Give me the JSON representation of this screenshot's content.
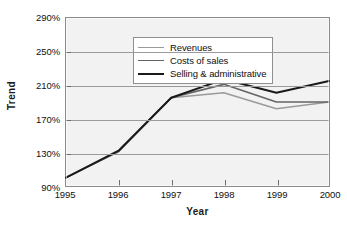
{
  "chart_data": {
    "type": "line",
    "title": "",
    "xlabel": "Year",
    "ylabel": "Trend",
    "categories": [
      "1995",
      "1996",
      "1997",
      "1998",
      "1999",
      "2000"
    ],
    "x": [
      1995,
      1996,
      1997,
      1998,
      1999,
      2000
    ],
    "xlim": [
      1995,
      2000
    ],
    "ylim": [
      90,
      290
    ],
    "yticks": [
      "90%",
      "130%",
      "170%",
      "210%",
      "250%",
      "290%"
    ],
    "ytick_values": [
      90,
      130,
      170,
      210,
      250,
      290
    ],
    "ytick_step": 40,
    "grid": "horizontal",
    "legend_position": "top-left",
    "series": [
      {
        "name": "Revenues",
        "color": "#9a9a9a",
        "values": [
          100,
          131,
          195,
          201,
          182,
          190
        ]
      },
      {
        "name": "Costs of sales",
        "color": "#646464",
        "values": [
          100,
          131,
          195,
          211,
          190,
          190
        ]
      },
      {
        "name": "Selling & administrative",
        "color": "#1a1a1a",
        "values": [
          100,
          132,
          195,
          217,
          201,
          215
        ]
      }
    ]
  },
  "axes": {
    "y_title": "Trend",
    "x_title": "Year"
  },
  "legend": {
    "items": [
      {
        "label": "Revenues"
      },
      {
        "label": "Costs of sales"
      },
      {
        "label": "Selling & administrative"
      }
    ]
  }
}
